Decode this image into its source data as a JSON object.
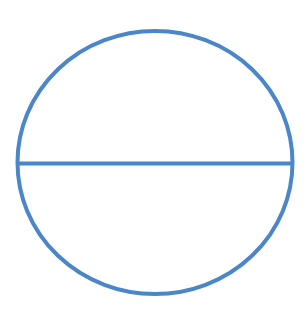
{
  "diagram": {
    "shapes": [
      {
        "type": "circle",
        "name": "circle-outline"
      },
      {
        "type": "line",
        "name": "diameter-line",
        "role": "horizontal diameter"
      }
    ],
    "colors": {
      "stroke": "#4a86c8",
      "background": "#ffffff"
    }
  }
}
